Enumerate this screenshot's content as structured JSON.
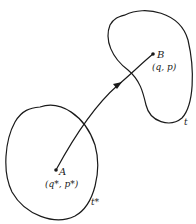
{
  "diagram": {
    "type": "phase-space flow",
    "colors": {
      "stroke": "#1a1a1a",
      "background": "#ffffff"
    },
    "regions": [
      {
        "id": "initial-region",
        "label": "t*"
      },
      {
        "id": "final-region",
        "label": "t"
      }
    ],
    "points": [
      {
        "id": "A",
        "name": "A",
        "coords": "(q*, p*)"
      },
      {
        "id": "B",
        "name": "B",
        "coords": "(q, p)"
      }
    ],
    "trajectory": {
      "from": "A",
      "to": "B",
      "arrow": true
    }
  }
}
